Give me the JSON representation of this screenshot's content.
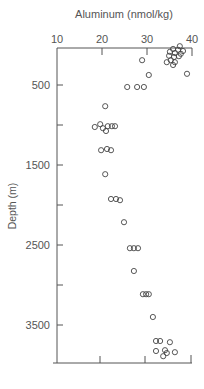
{
  "chart_data": {
    "type": "scatter",
    "title": "",
    "xlabel": "Aluminum (nmol/kg)",
    "ylabel": "Depth (m)",
    "xlim": [
      10,
      40
    ],
    "ylim": [
      0,
      4000
    ],
    "y_inverted": true,
    "x_axis_position": "top",
    "x_ticks": [
      10,
      20,
      30,
      40
    ],
    "y_ticks": [
      500,
      1500,
      2500,
      3500
    ],
    "y_minor_ticks": [
      1000,
      2000,
      3000
    ],
    "grid": false,
    "legend": null,
    "marker": "open-circle",
    "points": [
      {
        "x": 37.3,
        "y": 15
      },
      {
        "x": 35.8,
        "y": 50
      },
      {
        "x": 36.9,
        "y": 60
      },
      {
        "x": 38.0,
        "y": 75
      },
      {
        "x": 35.1,
        "y": 85
      },
      {
        "x": 36.2,
        "y": 100
      },
      {
        "x": 37.5,
        "y": 110
      },
      {
        "x": 34.9,
        "y": 135
      },
      {
        "x": 36.0,
        "y": 150
      },
      {
        "x": 37.1,
        "y": 140
      },
      {
        "x": 35.3,
        "y": 190
      },
      {
        "x": 36.2,
        "y": 215
      },
      {
        "x": 34.4,
        "y": 215
      },
      {
        "x": 35.8,
        "y": 250
      },
      {
        "x": 28.9,
        "y": 190
      },
      {
        "x": 30.4,
        "y": 375
      },
      {
        "x": 38.9,
        "y": 360
      },
      {
        "x": 25.6,
        "y": 525
      },
      {
        "x": 27.8,
        "y": 525
      },
      {
        "x": 29.3,
        "y": 525
      },
      {
        "x": 20.7,
        "y": 765
      },
      {
        "x": 18.4,
        "y": 1025
      },
      {
        "x": 19.6,
        "y": 990
      },
      {
        "x": 20.2,
        "y": 1040
      },
      {
        "x": 21.3,
        "y": 1015
      },
      {
        "x": 22.2,
        "y": 1015
      },
      {
        "x": 22.9,
        "y": 1015
      },
      {
        "x": 20.9,
        "y": 1075
      },
      {
        "x": 19.8,
        "y": 1315
      },
      {
        "x": 21.1,
        "y": 1300
      },
      {
        "x": 22.0,
        "y": 1315
      },
      {
        "x": 20.7,
        "y": 1615
      },
      {
        "x": 22.0,
        "y": 1925
      },
      {
        "x": 23.1,
        "y": 1925
      },
      {
        "x": 24.0,
        "y": 1940
      },
      {
        "x": 24.9,
        "y": 2215
      },
      {
        "x": 26.2,
        "y": 2540
      },
      {
        "x": 27.1,
        "y": 2540
      },
      {
        "x": 28.0,
        "y": 2540
      },
      {
        "x": 27.1,
        "y": 2825
      },
      {
        "x": 29.1,
        "y": 3115
      },
      {
        "x": 29.8,
        "y": 3115
      },
      {
        "x": 30.4,
        "y": 3115
      },
      {
        "x": 31.3,
        "y": 3400
      },
      {
        "x": 32.0,
        "y": 3700
      },
      {
        "x": 32.9,
        "y": 3700
      },
      {
        "x": 35.1,
        "y": 3715
      },
      {
        "x": 32.0,
        "y": 3825
      },
      {
        "x": 34.0,
        "y": 3815
      },
      {
        "x": 34.4,
        "y": 3850
      },
      {
        "x": 36.2,
        "y": 3840
      },
      {
        "x": 33.6,
        "y": 3890
      }
    ]
  },
  "colors": {
    "axis": "#555555",
    "marker_stroke": "#444444",
    "text": "#555555",
    "background": "#ffffff"
  }
}
